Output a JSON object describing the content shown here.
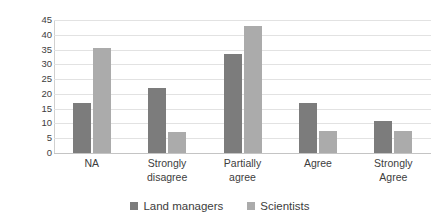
{
  "chart_data": {
    "type": "bar",
    "title": "",
    "subtitle": "",
    "xlabel": "",
    "ylabel": "Percentage of respondents",
    "categories": [
      "NA",
      "Strongly\ndisagree",
      "Partially\nagree",
      "Agree",
      "Strongly\nAgree"
    ],
    "series": [
      {
        "name": "Land managers",
        "color": "#7c7c7c",
        "values": [
          17,
          22,
          33.5,
          17,
          11
        ]
      },
      {
        "name": "Scientists",
        "color": "#ababab",
        "values": [
          35.5,
          7,
          43,
          7.5,
          7.5
        ]
      }
    ],
    "ylim": [
      0,
      45
    ],
    "ytick_step": 5,
    "yticks": [
      45,
      40,
      35,
      30,
      25,
      20,
      15,
      10,
      5,
      0
    ],
    "ytick_labels": [
      "45",
      "40",
      "35",
      "30",
      "25",
      "20",
      "15",
      "10",
      "5",
      "0"
    ],
    "grid": "horizontal",
    "legend_position": "bottom-center",
    "plot_background": "#ffffff",
    "gridline_color": "#e2e2e2"
  }
}
